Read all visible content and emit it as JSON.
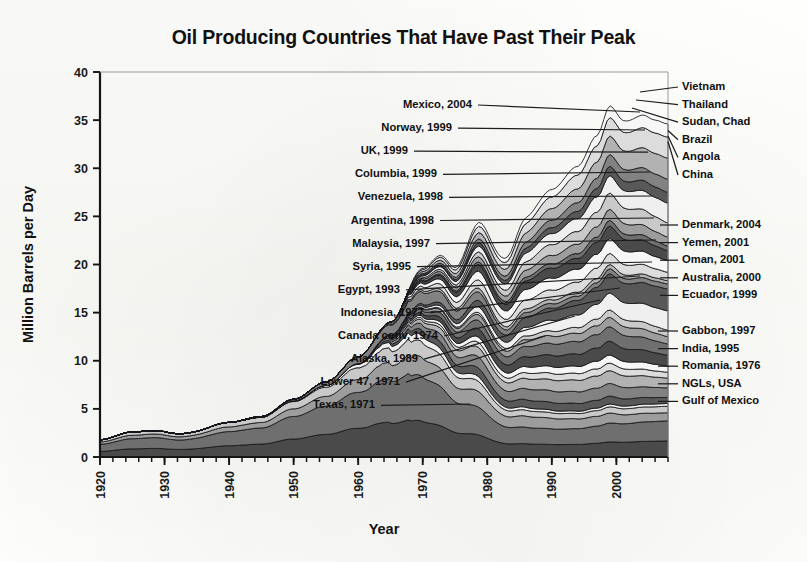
{
  "chart_data": {
    "type": "area",
    "title": "Oil Producing Countries That Have Past Their Peak",
    "xlabel": "Year",
    "ylabel": "Million Barrels per Day",
    "xlim": [
      1920,
      2008
    ],
    "ylim": [
      0,
      40
    ],
    "y_ticks": [
      0,
      5,
      10,
      15,
      20,
      25,
      30,
      35,
      40
    ],
    "x_ticks": [
      1920,
      1930,
      1940,
      1950,
      1960,
      1970,
      1980,
      1990,
      2000
    ],
    "x_minor_tick_interval": 2,
    "grid": false,
    "legend": "annotated leader lines on left and right of plot",
    "stacked": true,
    "x": [
      1920,
      1925,
      1930,
      1935,
      1940,
      1945,
      1950,
      1955,
      1960,
      1965,
      1970,
      1973,
      1975,
      1979,
      1983,
      1986,
      1990,
      1994,
      1997,
      1999,
      2001,
      2004,
      2006,
      2008
    ],
    "total_values": [
      1.8,
      2.6,
      3.0,
      2.9,
      3.6,
      4.2,
      6.0,
      7.8,
      10.4,
      14.0,
      19.6,
      21.2,
      20.4,
      24.6,
      22.4,
      25.2,
      27.8,
      30.2,
      33.4,
      36.5,
      35.2,
      35.6,
      35.0,
      34.6
    ],
    "peak": {
      "year": 1999,
      "value": 36.5
    },
    "series": [
      {
        "name": "Texas, 1971",
        "label_side": "left",
        "peak_year": 1971
      },
      {
        "name": "Lower 47, 1971",
        "label_side": "left",
        "peak_year": 1971
      },
      {
        "name": "Alaska, 1989",
        "label_side": "left",
        "peak_year": 1989
      },
      {
        "name": "Canada conv, 1974",
        "label_side": "left",
        "peak_year": 1974
      },
      {
        "name": "Indonesia, 1977",
        "label_side": "left",
        "peak_year": 1977
      },
      {
        "name": "Egypt, 1993",
        "label_side": "left",
        "peak_year": 1993
      },
      {
        "name": "Syria, 1995",
        "label_side": "left",
        "peak_year": 1995
      },
      {
        "name": "Malaysia, 1997",
        "label_side": "left",
        "peak_year": 1997
      },
      {
        "name": "Argentina, 1998",
        "label_side": "left",
        "peak_year": 1998
      },
      {
        "name": "Venezuela, 1998",
        "label_side": "left",
        "peak_year": 1998
      },
      {
        "name": "Columbia, 1999",
        "label_side": "left",
        "peak_year": 1999
      },
      {
        "name": "UK, 1999",
        "label_side": "left",
        "peak_year": 1999
      },
      {
        "name": "Norway, 1999",
        "label_side": "left",
        "peak_year": 1999
      },
      {
        "name": "Mexico, 2004",
        "label_side": "left",
        "peak_year": 2004
      },
      {
        "name": "Gulf of Mexico",
        "label_side": "right",
        "peak_year": null
      },
      {
        "name": "NGLs, USA",
        "label_side": "right",
        "peak_year": null
      },
      {
        "name": "Romania, 1976",
        "label_side": "right",
        "peak_year": 1976
      },
      {
        "name": "India, 1995",
        "label_side": "right",
        "peak_year": 1995
      },
      {
        "name": "Gabbon, 1997",
        "label_side": "right",
        "peak_year": 1997
      },
      {
        "name": "Ecuador, 1999",
        "label_side": "right",
        "peak_year": 1999
      },
      {
        "name": "Australia, 2000",
        "label_side": "right",
        "peak_year": 2000
      },
      {
        "name": "Oman, 2001",
        "label_side": "right",
        "peak_year": 2001
      },
      {
        "name": "Yemen, 2001",
        "label_side": "right",
        "peak_year": 2001
      },
      {
        "name": "Denmark, 2004",
        "label_side": "right",
        "peak_year": 2004
      },
      {
        "name": "China",
        "label_side": "right",
        "peak_year": null
      },
      {
        "name": "Angola",
        "label_side": "right",
        "peak_year": null
      },
      {
        "name": "Brazil",
        "label_side": "right",
        "peak_year": null
      },
      {
        "name": "Sudan, Chad",
        "label_side": "right",
        "peak_year": null
      },
      {
        "name": "Thailand",
        "label_side": "right",
        "peak_year": null
      },
      {
        "name": "Vietnam",
        "label_side": "right",
        "peak_year": null
      }
    ]
  },
  "axes": {
    "y_title": "Million Barrels per Day",
    "x_title": "Year",
    "y_tick_labels": [
      "0",
      "5",
      "10",
      "15",
      "20",
      "25",
      "30",
      "35",
      "40"
    ],
    "x_tick_labels": [
      "1920",
      "1930",
      "1940",
      "1950",
      "1960",
      "1970",
      "1980",
      "1990",
      "2000"
    ]
  },
  "annotations": {
    "left": [
      "Mexico, 2004",
      "Norway, 1999",
      "UK, 1999",
      "Columbia, 1999",
      "Venezuela, 1998",
      "Argentina, 1998",
      "Malaysia, 1997",
      "Syria, 1995",
      "Egypt, 1993",
      "Indonesia, 1977",
      "Canada conv, 1974",
      "Alaska, 1989",
      "Lower 47, 1971",
      "Texas, 1971"
    ],
    "right_top": [
      "Vietnam",
      "Thailand",
      "Sudan, Chad",
      "Brazil",
      "Angola",
      "China"
    ],
    "right_middle": [
      "Denmark, 2004",
      "Yemen, 2001",
      "Oman, 2001",
      "Australia, 2000",
      "Ecuador, 1999"
    ],
    "right_bottom": [
      "Gabbon, 1997",
      "India, 1995",
      "Romania, 1976",
      "NGLs, USA",
      "Gulf of Mexico"
    ]
  },
  "title": "Oil Producing Countries That Have Past Their Peak"
}
